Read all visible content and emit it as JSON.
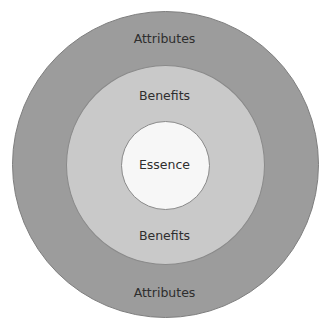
{
  "diagram": {
    "type": "concentric-circles",
    "layers": [
      {
        "name": "outer",
        "label_top": "Attributes",
        "label_bottom": "Attributes",
        "color": "#9c9c9c"
      },
      {
        "name": "middle",
        "label_top": "Benefits",
        "label_bottom": "Benefits",
        "color": "#c9c9c9"
      },
      {
        "name": "inner",
        "label": "Essence",
        "color": "#f7f7f7"
      }
    ]
  }
}
